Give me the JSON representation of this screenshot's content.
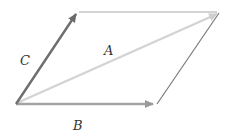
{
  "diagram": {
    "type": "vector-parallelogram",
    "labels": {
      "A": "A",
      "B": "B",
      "C": "C"
    },
    "vectors": [
      {
        "name": "A",
        "from": [
          16,
          104
        ],
        "to": [
          219,
          13
        ],
        "color": "#d3d3d3",
        "arrow": true
      },
      {
        "name": "B",
        "from": [
          16,
          104
        ],
        "to": [
          155,
          104
        ],
        "color": "#9e9e9e",
        "arrow": true
      },
      {
        "name": "C",
        "from": [
          16,
          104
        ],
        "to": [
          78,
          11
        ],
        "color": "#6e6e6e",
        "arrow": true
      }
    ],
    "edges": [
      {
        "name": "top-edge",
        "from": [
          78,
          12
        ],
        "to": [
          219,
          12
        ],
        "color": "#bdbdbd"
      },
      {
        "name": "right-edge",
        "from": [
          157,
          104
        ],
        "to": [
          219,
          12
        ],
        "color": "#7a7a7a"
      }
    ]
  }
}
